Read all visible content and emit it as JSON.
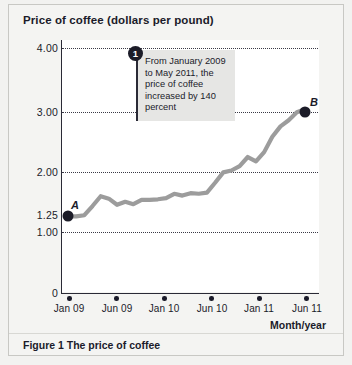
{
  "chart": {
    "title": "Price of coffee (dollars per pound)",
    "caption": "Figure 1  The price of coffee",
    "x_axis_title": "Month/year",
    "callout": {
      "badge": "1",
      "text": "From January 2009 to May 2011, the price of coffee increased by 140 percent"
    },
    "point_a_label": "A",
    "point_b_label": "B"
  },
  "chart_data": {
    "type": "line",
    "title": "Price of coffee (dollars per pound)",
    "xlabel": "Month/year",
    "ylabel": "Price of coffee (dollars per pound)",
    "ylim": [
      0,
      4.0
    ],
    "ytick_labels": [
      "4.00",
      "3.00",
      "2.00",
      "1.25",
      "1.00",
      "0"
    ],
    "ytick_values": [
      4.0,
      3.0,
      2.0,
      1.25,
      1.0,
      0
    ],
    "gridlines": [
      4.0,
      3.0,
      2.0,
      1.0
    ],
    "grid": true,
    "legend": "none",
    "xtick_labels": [
      "Jan 09",
      "Jun 09",
      "Jan 10",
      "Jun 10",
      "Jan 11",
      "Jun 11"
    ],
    "xtick_values": [
      "2009-01",
      "2009-06",
      "2010-01",
      "2010-06",
      "2011-01",
      "2011-06"
    ],
    "series": [
      {
        "name": "Price of coffee",
        "x": [
          "2009-01",
          "2009-02",
          "2009-03",
          "2009-04",
          "2009-05",
          "2009-06",
          "2009-07",
          "2009-08",
          "2009-09",
          "2009-10",
          "2009-11",
          "2009-12",
          "2010-01",
          "2010-02",
          "2010-03",
          "2010-04",
          "2010-05",
          "2010-06",
          "2010-07",
          "2010-08",
          "2010-09",
          "2010-10",
          "2010-11",
          "2010-12",
          "2011-01",
          "2011-02",
          "2011-03",
          "2011-04",
          "2011-05",
          "2011-06"
        ],
        "values": [
          1.25,
          1.25,
          1.27,
          1.42,
          1.58,
          1.54,
          1.44,
          1.49,
          1.45,
          1.52,
          1.52,
          1.53,
          1.55,
          1.62,
          1.59,
          1.63,
          1.62,
          1.64,
          1.8,
          1.97,
          2.0,
          2.07,
          2.22,
          2.15,
          2.3,
          2.55,
          2.72,
          2.82,
          2.95,
          3.0
        ]
      }
    ],
    "annotations": [
      {
        "id": "1",
        "text": "From January 2009 to May 2011, the price of coffee increased by 140 percent"
      },
      {
        "id": "A",
        "label": "A",
        "x": "2009-01",
        "y": 1.25
      },
      {
        "id": "B",
        "label": "B",
        "x": "2011-06",
        "y": 3.0
      }
    ]
  },
  "colors": {
    "line": "#9c9c9c",
    "marker": "#1c1c28",
    "axis": "#2a2a36",
    "grid": "#3a3a46",
    "callout_bg": "#e6e6e4",
    "page_bg": "#f2f2f0"
  }
}
